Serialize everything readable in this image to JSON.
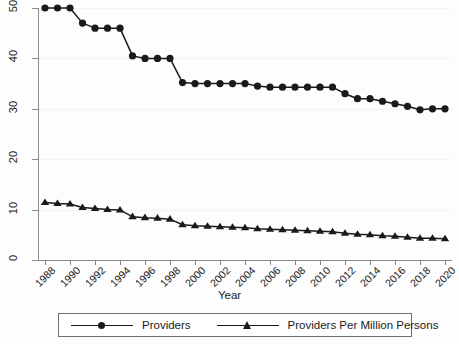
{
  "chart_data": {
    "type": "line",
    "title": "",
    "xlabel": "Year",
    "ylabel": "",
    "grid": true,
    "legend_position": "bottom",
    "x": [
      1988,
      1989,
      1990,
      1991,
      1992,
      1993,
      1994,
      1995,
      1996,
      1997,
      1998,
      1999,
      2000,
      2001,
      2002,
      2003,
      2004,
      2005,
      2006,
      2007,
      2008,
      2009,
      2010,
      2011,
      2012,
      2013,
      2014,
      2015,
      2016,
      2017,
      2018,
      2019,
      2020
    ],
    "xlim": [
      1988,
      2020
    ],
    "ylim": [
      0,
      50
    ],
    "yticks": [
      0,
      10,
      20,
      30,
      40,
      50
    ],
    "xticks": [
      1988,
      1990,
      1992,
      1994,
      1996,
      1998,
      2000,
      2002,
      2004,
      2006,
      2008,
      2010,
      2012,
      2014,
      2016,
      2018,
      2020
    ],
    "xtick_labels": [
      "1988",
      "1990",
      "1992",
      "1994",
      "1996",
      "1998",
      "2000",
      "2002",
      "2004",
      "2006",
      "2008",
      "2010",
      "2012",
      "2014",
      "2016",
      "2018",
      "2020"
    ],
    "ytick_labels": [
      "0",
      "10",
      "20",
      "30",
      "40",
      "50"
    ],
    "series": [
      {
        "name": "Providers",
        "marker": "circle",
        "color": "#1a1a1a",
        "values": [
          50,
          50,
          50,
          47,
          46,
          46,
          46,
          40.5,
          40,
          40,
          40,
          35.2,
          35,
          35,
          35,
          35,
          35,
          34.5,
          34.3,
          34.3,
          34.3,
          34.3,
          34.3,
          34.3,
          33,
          32,
          32,
          31.5,
          31,
          30.5,
          29.8,
          30,
          30
        ]
      },
      {
        "name": "Providers Per Million Persons",
        "marker": "triangle",
        "color": "#1a1a1a",
        "values": [
          11.4,
          11.2,
          11.1,
          10.4,
          10.2,
          10,
          9.9,
          8.6,
          8.4,
          8.3,
          8.1,
          7,
          6.8,
          6.7,
          6.6,
          6.5,
          6.4,
          6.2,
          6.1,
          6,
          5.9,
          5.8,
          5.7,
          5.6,
          5.3,
          5.1,
          5,
          4.8,
          4.7,
          4.5,
          4.3,
          4.3,
          4.2
        ]
      }
    ]
  },
  "axis": {
    "x_title": "Year"
  },
  "legend": {
    "entries": [
      {
        "label": "Providers"
      },
      {
        "label": "Providers Per Million Persons"
      }
    ]
  }
}
